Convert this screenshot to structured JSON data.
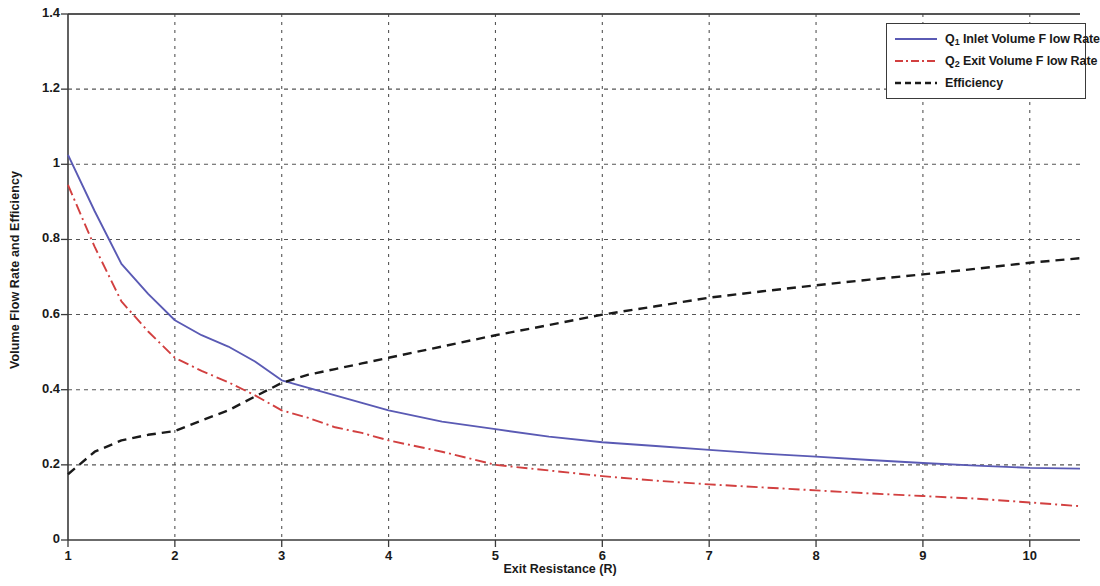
{
  "chart_data": {
    "type": "line",
    "title": "",
    "xlabel": "Exit Resistance (R)",
    "ylabel": "Volume Flow Rate and Efficiency",
    "xlim": [
      1,
      10.47
    ],
    "ylim": [
      0,
      1.4
    ],
    "xticks": [
      1,
      2,
      3,
      4,
      5,
      6,
      7,
      8,
      9,
      10
    ],
    "yticks": [
      0,
      0.2,
      0.4,
      0.6,
      0.8,
      1,
      1.2,
      1.4
    ],
    "xtick_labels": [
      "1",
      "2",
      "3",
      "4",
      "5",
      "6",
      "7",
      "8",
      "9",
      "10"
    ],
    "ytick_labels": [
      "0",
      "0.2",
      "0.4",
      "0.6",
      "0.8",
      "1",
      "1.2",
      "1.4"
    ],
    "grid": true,
    "grid_style": "dotted",
    "legend_position": "top-right",
    "x": [
      1,
      1.25,
      1.5,
      1.75,
      2,
      2.25,
      2.5,
      2.75,
      3,
      3.25,
      3.5,
      3.75,
      4,
      4.5,
      5,
      5.5,
      6,
      6.5,
      7,
      7.5,
      8,
      8.5,
      9,
      9.5,
      10,
      10.47
    ],
    "series": [
      {
        "name": "Q_1 Inlet Volume Flow Rate",
        "label": "Inlet Volume Flow Rate",
        "symbol": "Q",
        "subscript": "1",
        "color": "#5a5ab4",
        "style": "solid",
        "values": [
          1.025,
          0.875,
          0.735,
          0.655,
          0.585,
          0.545,
          0.515,
          0.475,
          0.425,
          0.405,
          0.385,
          0.365,
          0.345,
          0.315,
          0.295,
          0.275,
          0.26,
          0.25,
          0.24,
          0.23,
          0.222,
          0.213,
          0.205,
          0.198,
          0.192,
          0.19
        ]
      },
      {
        "name": "Q_2 Exit Volume Flow Rate",
        "label": "Exit Volume Flow Rate",
        "symbol": "Q",
        "subscript": "2",
        "color": "#d24040",
        "style": "dashdot",
        "values": [
          0.945,
          0.78,
          0.635,
          0.555,
          0.485,
          0.45,
          0.42,
          0.385,
          0.345,
          0.325,
          0.3,
          0.285,
          0.265,
          0.235,
          0.2,
          0.185,
          0.17,
          0.158,
          0.148,
          0.14,
          0.132,
          0.124,
          0.117,
          0.11,
          0.1,
          0.09
        ]
      },
      {
        "name": "Efficiency",
        "label": "Efficiency",
        "color": "#1a1a1a",
        "style": "dashed",
        "values": [
          0.175,
          0.235,
          0.265,
          0.28,
          0.29,
          0.318,
          0.345,
          0.382,
          0.418,
          0.44,
          0.455,
          0.47,
          0.485,
          0.515,
          0.545,
          0.572,
          0.6,
          0.622,
          0.645,
          0.662,
          0.678,
          0.693,
          0.707,
          0.722,
          0.738,
          0.75
        ]
      }
    ]
  },
  "legend": {
    "entries": [
      {
        "text_before": "Q",
        "sub": "1",
        "text_after": " Inlet Volume F low Rate"
      },
      {
        "text_before": "Q",
        "sub": "2",
        "text_after": " Exit Volume F low Rate"
      },
      {
        "text_before": "Efficiency",
        "sub": "",
        "text_after": ""
      }
    ]
  },
  "axes": {
    "xlabel": "Exit Resistance (R)",
    "ylabel": "Volume Flow Rate and Efficiency"
  }
}
